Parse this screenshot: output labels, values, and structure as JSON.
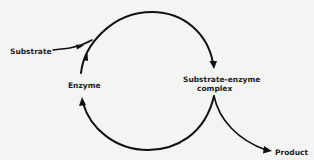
{
  "diagram": {
    "type": "enzyme-catalytic-cycle",
    "nodes": {
      "substrate": "Substrate",
      "enzyme": "Enzyme",
      "complex_line1": "Substrate-enzyme",
      "complex_line2": "complex",
      "product": "Product"
    },
    "edges": [
      {
        "from": "Substrate",
        "to": "Substrate-enzyme complex",
        "note": "substrate joins top arc"
      },
      {
        "from": "Enzyme",
        "to": "Substrate-enzyme complex",
        "note": "top arc, clockwise"
      },
      {
        "from": "Substrate-enzyme complex",
        "to": "Enzyme",
        "note": "bottom arc returns enzyme"
      },
      {
        "from": "Substrate-enzyme complex",
        "to": "Product",
        "note": "product released"
      }
    ],
    "colors": {
      "background": "#f4f4f2",
      "ink": "#111111"
    }
  }
}
